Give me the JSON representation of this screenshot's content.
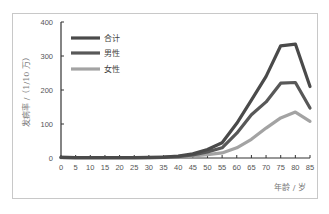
{
  "chart_data": {
    "type": "line",
    "title": "",
    "xlabel": "年龄 / 岁",
    "ylabel": "发病率 /（1/10 万）",
    "x": [
      0,
      5,
      10,
      15,
      20,
      25,
      30,
      35,
      40,
      45,
      50,
      55,
      60,
      65,
      70,
      75,
      80,
      85
    ],
    "xticks": [
      "0",
      "5",
      "10",
      "15",
      "20",
      "25",
      "30",
      "35",
      "40",
      "45",
      "50",
      "55",
      "60",
      "65",
      "70",
      "75",
      "80",
      "85"
    ],
    "yticks": [
      "0",
      "100",
      "200",
      "300",
      "400"
    ],
    "ylim": [
      0,
      400
    ],
    "xlim": [
      0,
      85
    ],
    "grid": false,
    "legend_position": "upper-left-inside",
    "series": [
      {
        "name": "合计",
        "color": "#4a4a4a",
        "values": [
          2,
          1,
          1,
          1,
          1,
          1,
          2,
          3,
          6,
          12,
          25,
          45,
          102,
          170,
          240,
          330,
          335,
          210
        ]
      },
      {
        "name": "男性",
        "color": "#585858",
        "values": [
          2,
          1,
          1,
          1,
          1,
          1,
          1,
          2,
          4,
          9,
          18,
          30,
          73,
          127,
          165,
          220,
          222,
          147
        ]
      },
      {
        "name": "女性",
        "color": "#a3a3a3",
        "values": [
          1,
          1,
          1,
          1,
          1,
          1,
          1,
          2,
          3,
          6,
          10,
          15,
          30,
          55,
          88,
          118,
          135,
          108
        ]
      }
    ]
  }
}
